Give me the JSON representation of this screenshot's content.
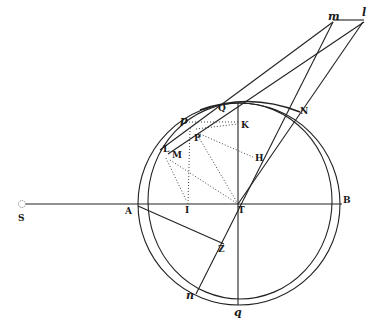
{
  "diagram": {
    "labels": {
      "S": "S",
      "A": "A",
      "B": "B",
      "T": "T",
      "I": "I",
      "Z": "Z",
      "P": "P",
      "K": "K",
      "H": "H",
      "L": "L",
      "M": "M",
      "Q": "Q",
      "N": "N",
      "p": "p",
      "n": "n",
      "q": "q",
      "m": "m",
      "l": "l"
    },
    "colors": {
      "ink": "#222222",
      "background": "#ffffff"
    }
  }
}
